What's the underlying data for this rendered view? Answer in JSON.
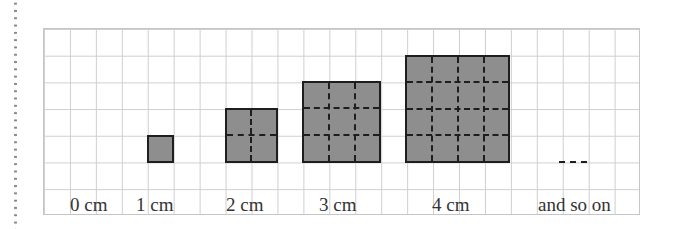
{
  "figure": {
    "labels": [
      "0 cm",
      "1 cm",
      "2 cm",
      "3 cm",
      "4 cm",
      "and so on"
    ],
    "squares": [
      {
        "side_cm": 1,
        "label": "1 cm"
      },
      {
        "side_cm": 2,
        "label": "2 cm"
      },
      {
        "side_cm": 3,
        "label": "3 cm"
      },
      {
        "side_cm": 4,
        "label": "4 cm"
      }
    ],
    "continuation": "----",
    "colors": {
      "fill": "#8e8e8e",
      "border": "#1e1e1e",
      "grid": "#cfcfcf"
    }
  }
}
